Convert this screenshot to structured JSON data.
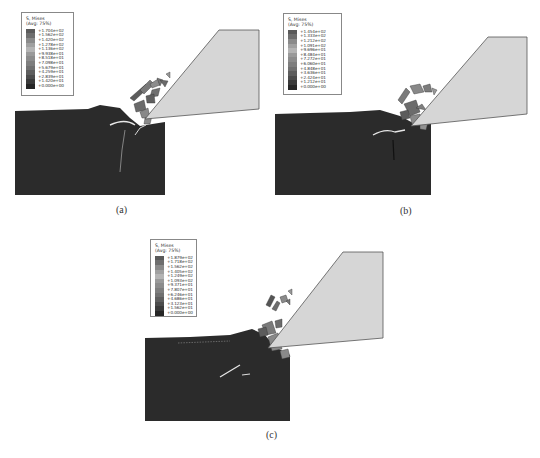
{
  "figure": {
    "panels": [
      {
        "label": "(a)",
        "legend": {
          "title_line1": "S, Mises",
          "title_line2": "(Avg: 75%)",
          "values": [
            "+1.704e+02",
            "+1.562e+02",
            "+1.420e+02",
            "+1.278e+02",
            "+1.136e+02",
            "+9.938e+01",
            "+8.518e+01",
            "+7.098e+01",
            "+5.679e+01",
            "+4.259e+01",
            "+2.839e+01",
            "+1.420e+01",
            "+0.000e+00"
          ]
        }
      },
      {
        "label": "(b)",
        "legend": {
          "title_line1": "S, Mises",
          "title_line2": "(Avg: 75%)",
          "values": [
            "+1.454e+02",
            "+1.333e+02",
            "+1.212e+02",
            "+1.091e+02",
            "+9.696e+01",
            "+8.484e+01",
            "+7.272e+01",
            "+6.060e+01",
            "+4.848e+01",
            "+3.636e+01",
            "+2.424e+01",
            "+1.212e+01",
            "+0.000e+00"
          ]
        }
      },
      {
        "label": "(c)",
        "legend": {
          "title_line1": "S, Mises",
          "title_line2": "(Avg: 75%)",
          "values": [
            "+1.879e+02",
            "+1.718e+02",
            "+1.562e+02",
            "+1.405e+02",
            "+1.249e+02",
            "+1.093e+02",
            "+9.371e+01",
            "+7.807e+01",
            "+6.246e+01",
            "+4.686e+01",
            "+3.123e+01",
            "+1.562e+01",
            "+0.000e+00"
          ]
        }
      }
    ],
    "colors": {
      "workpiece": "#2b2b2b",
      "tool_fill": "#d6d6d6",
      "tool_stroke": "#555555",
      "legend_bands": [
        "#5a5a5a",
        "#6e6e6e",
        "#8a8a8a",
        "#a0a0a0",
        "#b4b4b4",
        "#9a9a9a",
        "#8c8c8c",
        "#7e7e7e",
        "#707070",
        "#5e5e5e",
        "#4c4c4c",
        "#3a3a3a",
        "#262626"
      ]
    }
  }
}
